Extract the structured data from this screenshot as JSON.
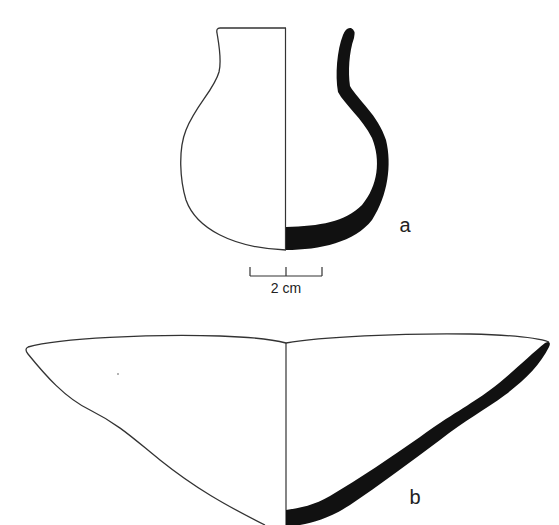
{
  "figure": {
    "vessels": [
      {
        "id": "a",
        "label": "a",
        "type": "jar profile (half section)"
      },
      {
        "id": "b",
        "label": "b",
        "type": "bowl profile (half section)"
      }
    ],
    "scale_bar": {
      "label": "2 cm"
    },
    "colors": {
      "outline": "#333333",
      "section_fill": "#111111",
      "background": "#ffffff"
    }
  }
}
